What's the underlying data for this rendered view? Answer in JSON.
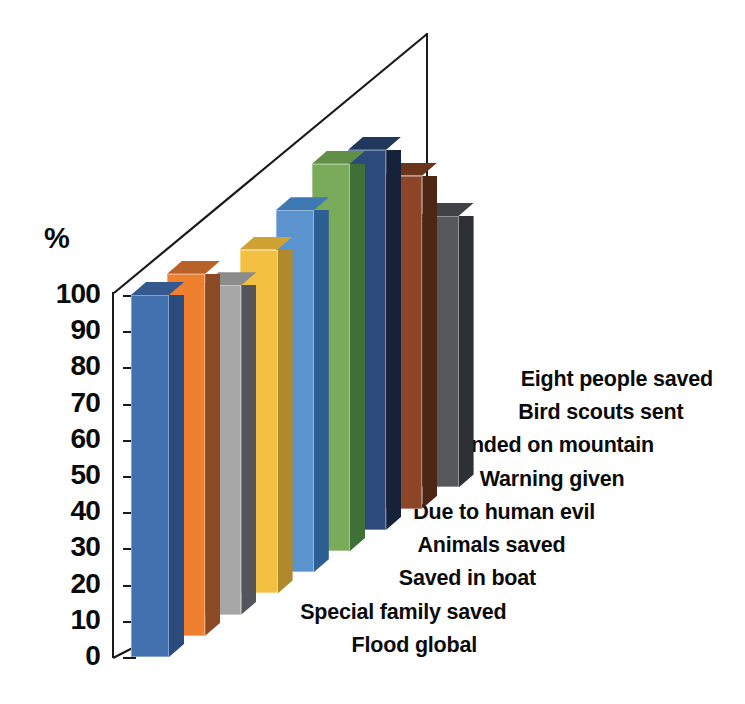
{
  "chart_data": {
    "type": "bar",
    "title": "",
    "subtitle": "",
    "xlabel": "",
    "ylabel": "%",
    "ylim": [
      0,
      100
    ],
    "grid": false,
    "legend": "none",
    "style": "3d-perspective-column",
    "ytick_labels": [
      "100",
      "90",
      "80",
      "70",
      "60",
      "50",
      "40",
      "30",
      "20",
      "10",
      "0"
    ],
    "ytick_values": [
      100,
      90,
      80,
      70,
      60,
      50,
      40,
      30,
      20,
      10,
      0
    ],
    "categories": [
      "Flood global",
      "Special family saved",
      "Saved in boat",
      "Animals saved",
      "Due to human evil",
      "Warning given",
      "Landed on mountain",
      "Bird scouts sent",
      "Eight people saved"
    ],
    "values": [
      100,
      100,
      91,
      95,
      100,
      107,
      105,
      92,
      75
    ],
    "bar_colors": [
      "#4371b0",
      "#ee8030",
      "#a6a6a6",
      "#f3c042",
      "#5b93cf",
      "#7aab5a",
      "#2d4a7c",
      "#8c4527",
      "#57585c"
    ],
    "bar_side_colors": [
      "#2b4a7d",
      "#8c4a24",
      "#53555b",
      "#b08a2a",
      "#2d5f93",
      "#3f7038",
      "#16213c",
      "#4e2615",
      "#2e3034"
    ],
    "bar_top_colors": [
      "#35598f",
      "#b86129",
      "#8c8c8c",
      "#cfa234",
      "#3f79b3",
      "#628f47",
      "#21375c",
      "#6b351c",
      "#404246"
    ]
  },
  "axis": {
    "unit_label": "%"
  }
}
